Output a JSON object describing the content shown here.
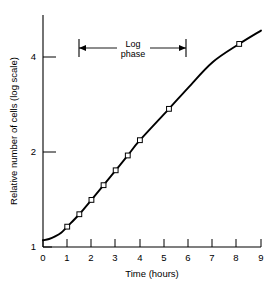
{
  "chart_data": {
    "type": "line",
    "title": "",
    "xlabel": "Time (hours)",
    "ylabel": "Relative number of cells (log scale)",
    "yscale": "log",
    "xlim": [
      0,
      9
    ],
    "ylim": [
      1,
      5.2
    ],
    "grid": false,
    "legend": null,
    "xticks": [
      "0",
      "1",
      "2",
      "3",
      "4",
      "5",
      "6",
      "7",
      "8",
      "9"
    ],
    "xtick_values": [
      0,
      1,
      2,
      3,
      4,
      5,
      6,
      7,
      8,
      9
    ],
    "yticks": [
      "1",
      "2",
      "4"
    ],
    "ytick_values": [
      1,
      2,
      4
    ],
    "series": [
      {
        "name": "Relative number of cells",
        "x": [
          0,
          0.25,
          0.5,
          0.75,
          1,
          1.5,
          2,
          2.5,
          3,
          3.5,
          4,
          5.2,
          6,
          7,
          8.1,
          9
        ],
        "y": [
          1.05,
          1.06,
          1.08,
          1.11,
          1.16,
          1.27,
          1.41,
          1.57,
          1.75,
          1.95,
          2.18,
          2.74,
          3.2,
          3.85,
          4.4,
          4.85
        ],
        "marker_x": [
          1,
          1.5,
          2,
          2.5,
          3,
          3.5,
          4,
          5.2,
          8.1
        ],
        "marker_y": [
          1.16,
          1.27,
          1.41,
          1.57,
          1.75,
          1.95,
          2.18,
          2.74,
          4.4
        ]
      }
    ],
    "annotations": [
      {
        "text_line1": "Log",
        "text_line2": "phase",
        "type": "double-arrow-span",
        "x_start": 1.5,
        "x_end": 6.0,
        "y_position": 4.35
      }
    ]
  },
  "axes": {
    "x_axis_label": "Time (hours)",
    "y_axis_label": "Relative number of cells (log scale)"
  },
  "annotation": {
    "log_label_line1": "Log",
    "log_label_line2": "phase"
  },
  "colors": {
    "background": "#ffffff",
    "axis": "#000000",
    "curve": "#000000",
    "marker_fill": "#ffffff"
  }
}
